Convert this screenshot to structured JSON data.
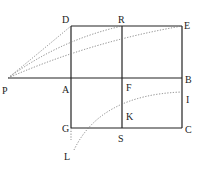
{
  "diagram": {
    "type": "geometric-construction",
    "points": {
      "P": {
        "x": 8,
        "y": 78
      },
      "D": {
        "x": 71,
        "y": 26
      },
      "R": {
        "x": 122,
        "y": 26
      },
      "E": {
        "x": 182,
        "y": 26
      },
      "A": {
        "x": 71,
        "y": 78
      },
      "F": {
        "x": 122,
        "y": 78
      },
      "B": {
        "x": 182,
        "y": 78
      },
      "G": {
        "x": 71,
        "y": 128
      },
      "S": {
        "x": 122,
        "y": 128
      },
      "C": {
        "x": 182,
        "y": 128
      },
      "I": {
        "x": 182,
        "y": 92
      },
      "K": {
        "x": 122,
        "y": 106
      },
      "L": {
        "x": 71,
        "y": 152
      }
    },
    "labels": {
      "P": "P",
      "D": "D",
      "R": "R",
      "E": "E",
      "A": "A",
      "F": "F",
      "B": "B",
      "G": "G",
      "S": "S",
      "C": "C",
      "I": "I",
      "K": "K",
      "L": "L"
    },
    "solid_lines": [
      "PB",
      "DE",
      "GC",
      "DG",
      "RS",
      "EC"
    ],
    "dotted_curves": [
      "PD",
      "PR",
      "PE",
      "LI",
      "GL"
    ],
    "colors": {
      "line": "#222222",
      "dotted": "#777777"
    }
  }
}
